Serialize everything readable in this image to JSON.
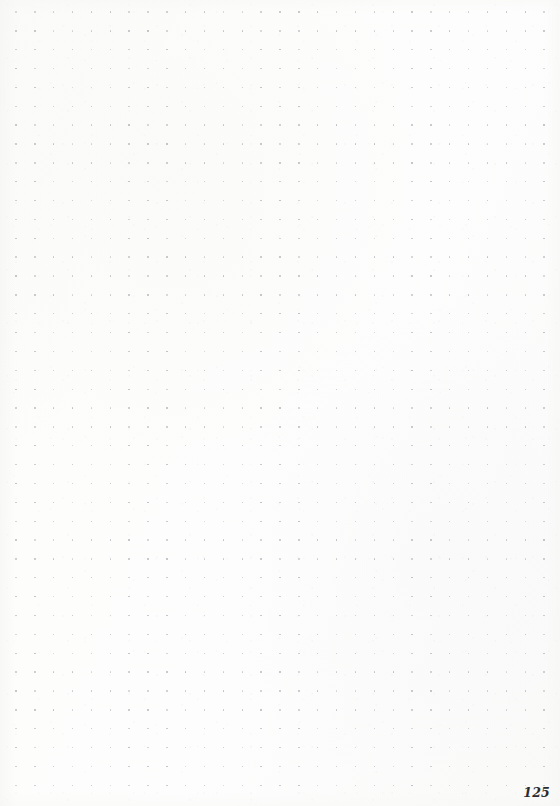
{
  "page": {
    "type": "dot-grid-notebook-page",
    "width": 560,
    "height": 806,
    "paper_color": "#fcfcfb",
    "content": "",
    "is_blank": true
  },
  "grid": {
    "dot_color": "#b9b9be",
    "dot_size_px": 1.4,
    "spacing_px": 18.86,
    "origin_x_px": 16,
    "origin_y_px": 12,
    "columns": 29,
    "rows": 42
  },
  "footer": {
    "page_number": "125"
  }
}
